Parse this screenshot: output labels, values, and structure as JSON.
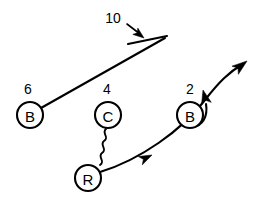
{
  "diagram": {
    "background_color": "#ffffff",
    "ink_color": "#000000",
    "width": 268,
    "height": 201,
    "players": [
      {
        "id": "player-b-left",
        "letter": "B",
        "route_number": "6",
        "cx": 30,
        "cy": 115,
        "r": 13,
        "label_x": 28,
        "label_y": 89
      },
      {
        "id": "player-c",
        "letter": "C",
        "route_number": "4",
        "cx": 108,
        "cy": 115,
        "r": 13,
        "label_x": 107,
        "label_y": 89
      },
      {
        "id": "player-b-right",
        "letter": "B",
        "route_number": "2",
        "cx": 190,
        "cy": 115,
        "r": 13,
        "label_x": 190,
        "label_y": 89
      },
      {
        "id": "player-r",
        "letter": "R",
        "route_number": "",
        "cx": 88,
        "cy": 178,
        "r": 13,
        "label_x": 0,
        "label_y": 0
      }
    ],
    "annotations": [
      {
        "id": "callout-10",
        "text": "10",
        "label_x": 113,
        "label_y": 18,
        "pointer_from_x": 126,
        "pointer_from_y": 23,
        "pointer_to_x": 143,
        "pointer_to_y": 36
      }
    ],
    "routes": [
      {
        "id": "route-b-left-block",
        "from": "player-b-left",
        "style": "solid-line",
        "terminator": "block-bar",
        "description": "B (6) runs up-field to the right ending in a block bar"
      },
      {
        "id": "route-c-to-r-motion",
        "from": "player-c",
        "to": "player-r",
        "style": "wavy-line",
        "terminator": "none",
        "description": "Squiggly motion line from C (4) down to R"
      },
      {
        "id": "route-r-deep",
        "from": "player-r",
        "style": "curved-line",
        "terminator": "arrowhead",
        "description": "R runs a deep curving route up and to the right past B (2), ending in an arrowhead"
      },
      {
        "id": "route-b-right-hook",
        "from": "player-b-right",
        "style": "short-hook",
        "terminator": "arrowhead",
        "description": "B (2) runs a short hook up with an arrowhead"
      }
    ]
  }
}
